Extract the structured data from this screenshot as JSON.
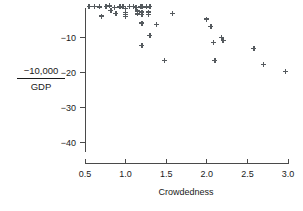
{
  "chart_data": {
    "type": "scatter",
    "title": "",
    "subtitle": "",
    "xlabel": "Crowdedness",
    "ylabel_numerator": "−10,000",
    "ylabel_denominator": "GDP",
    "ylabel": "-10,000 / GDP",
    "xlim": [
      0.38,
      3.1
    ],
    "ylim": [
      -45,
      0.5
    ],
    "xticks": [
      0.5,
      1.0,
      1.5,
      2.0,
      2.5,
      3.0
    ],
    "xticklabels": [
      "0.5",
      "1.0",
      "1.5",
      "2.0",
      "2.5",
      "3.0"
    ],
    "yticks": [
      -10,
      -20,
      -30,
      -40
    ],
    "yticklabels": [
      "−10",
      "−20",
      "−30",
      "−40"
    ],
    "grid": false,
    "legend": null,
    "marker": "plus",
    "marker_color": "#555a5e",
    "points": [
      [
        0.55,
        -1.3
      ],
      [
        0.62,
        -1.3
      ],
      [
        0.68,
        -1.4
      ],
      [
        0.7,
        -4.0
      ],
      [
        0.76,
        -1.3
      ],
      [
        0.8,
        -1.1
      ],
      [
        0.82,
        -2.4
      ],
      [
        0.86,
        -1.5
      ],
      [
        0.88,
        -3.2
      ],
      [
        0.93,
        -1.4
      ],
      [
        0.97,
        -1.2
      ],
      [
        1.0,
        -1.8
      ],
      [
        1.0,
        -3.0
      ],
      [
        1.0,
        -3.6
      ],
      [
        1.0,
        -4.2
      ],
      [
        1.05,
        -1.3
      ],
      [
        1.1,
        -1.2
      ],
      [
        1.13,
        -1.5
      ],
      [
        1.15,
        -2.6
      ],
      [
        1.15,
        -3.4
      ],
      [
        1.18,
        -1.3
      ],
      [
        1.2,
        -1.4
      ],
      [
        1.2,
        -2.9
      ],
      [
        1.2,
        -3.5
      ],
      [
        1.2,
        -6.0
      ],
      [
        1.2,
        -12.4
      ],
      [
        1.26,
        -1.4
      ],
      [
        1.28,
        -2.9
      ],
      [
        1.28,
        -3.6
      ],
      [
        1.3,
        -1.3
      ],
      [
        1.3,
        -9.5
      ],
      [
        1.38,
        -6.5
      ],
      [
        1.48,
        -16.8
      ],
      [
        1.58,
        -3.3
      ],
      [
        2.0,
        -4.9
      ],
      [
        2.05,
        -7.0
      ],
      [
        2.08,
        -11.6
      ],
      [
        2.1,
        -16.8
      ],
      [
        2.18,
        -10.2
      ],
      [
        2.2,
        -11.0
      ],
      [
        2.58,
        -13.3
      ],
      [
        2.7,
        -17.9
      ],
      [
        2.97,
        -19.8
      ]
    ]
  },
  "axes_geometry": {
    "x_left_px": 85,
    "x_right_px": 288,
    "x_left_val": 0.5,
    "x_right_val": 3.0,
    "y_top_px": 37,
    "y_bottom_px": 142,
    "y_top_val": -10,
    "y_bottom_val": -40,
    "vaxis_top_px": 8,
    "vaxis_bottom_px": 152,
    "haxis_y_px": 163
  }
}
